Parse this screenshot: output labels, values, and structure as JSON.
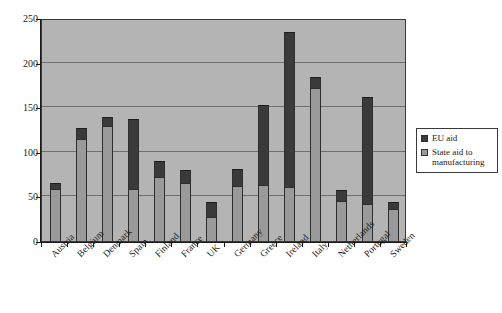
{
  "chart_data": {
    "type": "bar",
    "subtype": "stacked-vertical",
    "title": "",
    "xlabel": "",
    "ylabel": "",
    "ylim": [
      0,
      250
    ],
    "ytick_values": [
      0,
      50,
      100,
      150,
      200,
      250
    ],
    "ytick_labels": [
      "0",
      "50",
      "100",
      "150",
      "200",
      "250"
    ],
    "grid": "horizontal",
    "legend_position": "right",
    "plot_background": "#b4b4b4",
    "categories": [
      "Austria",
      "Belgium",
      "Denmark",
      "Spain",
      "Finland",
      "France",
      "UK",
      "Germany",
      "Greece",
      "Ireland",
      "Italy",
      "Netherlands",
      "Portugal",
      "Sweden"
    ],
    "series": [
      {
        "name": "State aid to manufacturing",
        "color": "#9a9a9a",
        "values": [
          58,
          114,
          129,
          58,
          72,
          65,
          27,
          62,
          63,
          60,
          172,
          45,
          42,
          36
        ]
      },
      {
        "name": "EU aid",
        "color": "#3a3a3a",
        "values": [
          7,
          13,
          10,
          79,
          18,
          15,
          17,
          19,
          89,
          174,
          12,
          12,
          119,
          8
        ]
      }
    ],
    "totals": [
      65,
      127,
      139,
      137,
      90,
      80,
      44,
      81,
      152,
      234,
      184,
      57,
      161,
      44
    ]
  },
  "legend": {
    "entries": [
      {
        "label": "EU aid",
        "color": "#3a3a3a"
      },
      {
        "label": "State aid to manufacturing",
        "color": "#9a9a9a"
      }
    ]
  }
}
